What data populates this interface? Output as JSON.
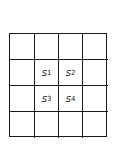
{
  "diagram": {
    "rows": 4,
    "cols": 4,
    "cells": [
      [
        "",
        "",
        "",
        ""
      ],
      [
        "",
        {
          "var": "s",
          "sub": "1"
        },
        {
          "var": "s",
          "sub": "2"
        },
        ""
      ],
      [
        "",
        {
          "var": "s",
          "sub": "3"
        },
        {
          "var": "s",
          "sub": "4"
        },
        ""
      ],
      [
        "",
        "",
        "",
        ""
      ]
    ],
    "labels": {
      "s1": {
        "var": "s",
        "sub": "1"
      },
      "s2": {
        "var": "s",
        "sub": "2"
      },
      "s3": {
        "var": "s",
        "sub": "3"
      },
      "s4": {
        "var": "s",
        "sub": "4"
      }
    },
    "line_color": "#1a1a1a"
  }
}
